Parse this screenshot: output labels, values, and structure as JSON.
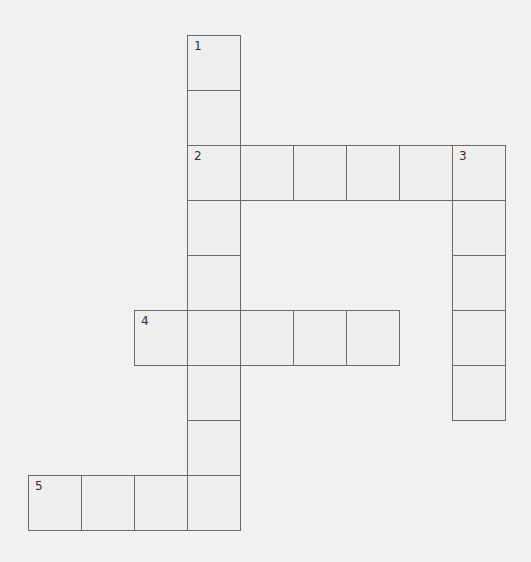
{
  "puzzle": {
    "type": "crossword",
    "cell_width": 53,
    "cell_height": 55,
    "origin_x": 28,
    "origin_y": 35,
    "colors": {
      "background": "#f1f1f1",
      "cell_border": "#6a6a6a",
      "number": "#333333"
    },
    "clues": [
      {
        "number": "1",
        "direction": "down",
        "col": 3,
        "row": 0,
        "length": 9
      },
      {
        "number": "2",
        "direction": "across",
        "col": 3,
        "row": 2,
        "length": 6
      },
      {
        "number": "3",
        "direction": "down",
        "col": 8,
        "row": 2,
        "length": 5
      },
      {
        "number": "4",
        "direction": "across",
        "col": 2,
        "row": 5,
        "length": 5
      },
      {
        "number": "5",
        "direction": "across",
        "col": 0,
        "row": 8,
        "length": 4
      }
    ]
  }
}
